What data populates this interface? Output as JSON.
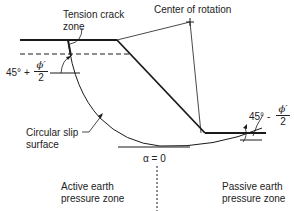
{
  "diagram": {
    "labels": {
      "tension_crack": "Tension crack",
      "tension_crack_zone": "zone",
      "center_of_rotation": "Center of rotation",
      "circular_slip_line1": "Circular slip",
      "circular_slip_line2": "surface",
      "active_line1": "Active earth",
      "active_line2": "pressure zone",
      "passive_line1": "Passive earth",
      "passive_line2": "pressure zone",
      "alpha_zero": "α = 0"
    },
    "angle_active": {
      "prefix": "45° +",
      "numerator": "ϕ′",
      "denominator": "2"
    },
    "angle_passive": {
      "prefix": "45° -",
      "numerator": "ϕ′",
      "denominator": "2"
    },
    "colors": {
      "line": "#1a1a1a",
      "background": "#ffffff"
    }
  }
}
